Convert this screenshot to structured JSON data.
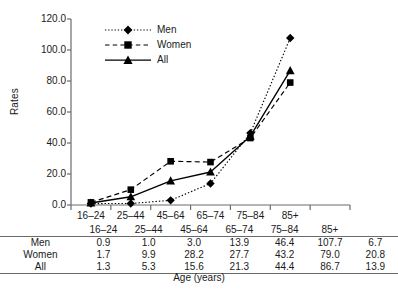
{
  "chart_data": {
    "type": "line",
    "title": "",
    "xlabel": "Age (years)",
    "ylabel": "Rates",
    "categories": [
      "16–24",
      "25–44",
      "45–64",
      "65–74",
      "75–84",
      "85+",
      ""
    ],
    "series": [
      {
        "name": "Men",
        "values": [
          0.9,
          1.0,
          3.0,
          13.9,
          46.4,
          107.7,
          6.7
        ],
        "marker": "diamond",
        "line_style": "dotted"
      },
      {
        "name": "Women",
        "values": [
          1.7,
          9.9,
          28.2,
          27.7,
          43.2,
          79.0,
          20.8
        ],
        "marker": "square",
        "line_style": "dashed"
      },
      {
        "name": "All",
        "values": [
          1.3,
          5.3,
          15.6,
          21.3,
          44.4,
          86.7,
          13.9
        ],
        "marker": "triangle",
        "line_style": "solid"
      }
    ],
    "plotted_categories": [
      "16–24",
      "25–44",
      "45–64",
      "65–74",
      "75–84",
      "85+"
    ],
    "ylim": [
      0,
      120
    ],
    "ytick_interval": 20,
    "ytick_labels": [
      "0.0",
      "20.0",
      "40.0",
      "60.0",
      "80.0",
      "100.0",
      "120.0"
    ],
    "grid": false,
    "legend_position": "top-left-inside",
    "series_color": "#000000"
  },
  "legend": {
    "items": [
      {
        "label": "Men",
        "marker": "diamond-marker",
        "style": "dotted"
      },
      {
        "label": "Women",
        "marker": "square-marker",
        "style": "dashed"
      },
      {
        "label": "All",
        "marker": "triangle-marker",
        "style": "solid"
      }
    ]
  },
  "table": {
    "header": [
      "16–24",
      "25–44",
      "45–64",
      "65–74",
      "75–84",
      "85+",
      ""
    ],
    "rows": [
      {
        "label": "Men",
        "values": [
          "0.9",
          "1.0",
          "3.0",
          "13.9",
          "46.4",
          "107.7",
          "6.7"
        ]
      },
      {
        "label": "Women",
        "values": [
          "1.7",
          "9.9",
          "28.2",
          "27.7",
          "43.2",
          "79.0",
          "20.8"
        ]
      },
      {
        "label": "All",
        "values": [
          "1.3",
          "5.3",
          "15.6",
          "21.3",
          "44.4",
          "86.7",
          "13.9"
        ]
      }
    ]
  },
  "axes": {
    "y_title": "Rates",
    "x_title": "Age (years)"
  }
}
